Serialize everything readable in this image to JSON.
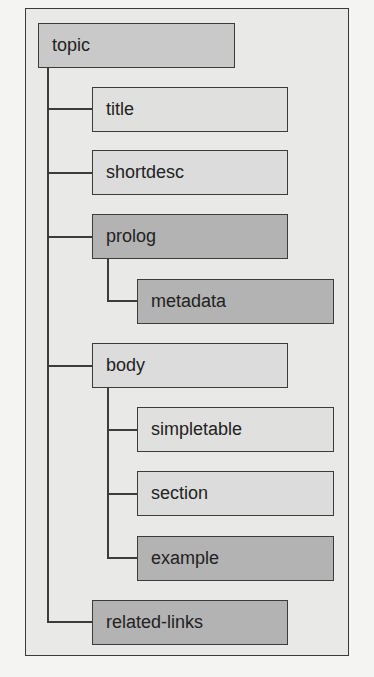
{
  "diagram": {
    "type": "tree",
    "root": "topic",
    "nodes": [
      {
        "id": "topic",
        "label": "topic",
        "level": 0,
        "tone": "mid"
      },
      {
        "id": "title",
        "label": "title",
        "level": 1,
        "parent": "topic",
        "tone": "lighter"
      },
      {
        "id": "shortdesc",
        "label": "shortdesc",
        "level": 1,
        "parent": "topic",
        "tone": "light"
      },
      {
        "id": "prolog",
        "label": "prolog",
        "level": 1,
        "parent": "topic",
        "tone": "dark"
      },
      {
        "id": "metadata",
        "label": "metadata",
        "level": 2,
        "parent": "prolog",
        "tone": "dark"
      },
      {
        "id": "body",
        "label": "body",
        "level": 1,
        "parent": "topic",
        "tone": "light"
      },
      {
        "id": "simpletable",
        "label": "simpletable",
        "level": 2,
        "parent": "body",
        "tone": "lighter"
      },
      {
        "id": "section",
        "label": "section",
        "level": 2,
        "parent": "body",
        "tone": "light"
      },
      {
        "id": "example",
        "label": "example",
        "level": 2,
        "parent": "body",
        "tone": "dark"
      },
      {
        "id": "related-links",
        "label": "related-links",
        "level": 1,
        "parent": "topic",
        "tone": "dark"
      }
    ]
  },
  "colors": {
    "background": "#f4f4f2",
    "frame": "#e9e9e7",
    "border": "#3c3c3c",
    "dark": "#b3b3b3",
    "mid": "#c9c9c9",
    "light": "#dcdcdc",
    "lighter": "#e0e0de"
  }
}
